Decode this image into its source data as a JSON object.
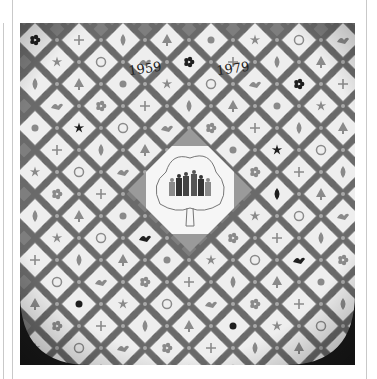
{
  "page": {
    "background": "#ffffff",
    "photo": {
      "subject": "Embroidered commemorative quilt with diamond-set appliqué blocks",
      "colors": {
        "ground": "#7e7e7e",
        "sashing": "#6a6a6a",
        "block": "#eeeeee",
        "medallion": "#f6f6f6",
        "corner_shadow": "#1a1a1a",
        "motif_dark": "#1e1e1e",
        "motif_mid": "#8a8a8a"
      },
      "labels": {
        "year_left": "1959",
        "year_right": "1979"
      },
      "center_medallion": {
        "motif": "tree-with-family-figures"
      },
      "grid": {
        "rows": 15,
        "columns_per_row": 8,
        "pitch_px": 44
      }
    }
  }
}
